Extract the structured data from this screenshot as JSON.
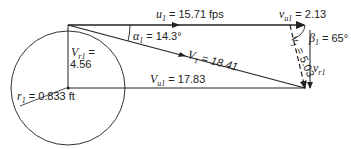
{
  "diagram": {
    "type": "velocity-triangle",
    "labels": {
      "u1": {
        "symbol": "u",
        "sub": "1",
        "text": "= 15.71 fps"
      },
      "vu1": {
        "symbol": "v",
        "sub": "u1",
        "text": "= 2.13"
      },
      "alpha1": {
        "symbol": "α",
        "sub": "1",
        "text": "= 14.3°"
      },
      "beta1": {
        "symbol": "β",
        "sub": "1",
        "text": "= 65°"
      },
      "Vr1": {
        "symbol": "V",
        "sub": "r1",
        "text_line1": "=",
        "text_line2": "4.56"
      },
      "V1": {
        "symbol": "V",
        "sub": "1",
        "text": "= 18.41"
      },
      "v1": {
        "symbol": "v",
        "sub": "1",
        "text": "= 5.03"
      },
      "vr1": {
        "symbol": "v",
        "sub": "r1"
      },
      "Vu1": {
        "symbol": "V",
        "sub": "u1",
        "text": "= 17.83"
      },
      "r1": {
        "symbol": "r",
        "sub": "1",
        "text": "= 0.833 ft"
      }
    },
    "colors": {
      "stroke": "#222222",
      "background": "#ffffff"
    }
  }
}
